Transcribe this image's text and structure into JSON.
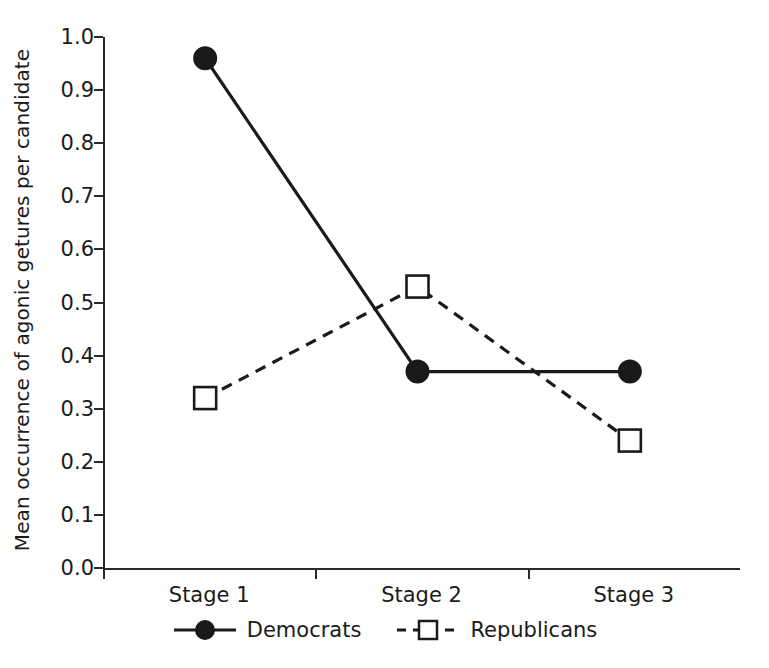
{
  "chart_data": {
    "type": "line",
    "title": "",
    "xlabel": "",
    "ylabel": "Mean occurrence of agonic getures per candidate",
    "categories": [
      "Stage 1",
      "Stage 2",
      "Stage 3"
    ],
    "ylim": [
      0.0,
      1.0
    ],
    "ytick_labels": [
      "0.0",
      "0.1",
      "0.2",
      "0.3",
      "0.4",
      "0.5",
      "0.6",
      "0.7",
      "0.8",
      "0.9",
      "1.0"
    ],
    "ytick_values": [
      0.0,
      0.1,
      0.2,
      0.3,
      0.4,
      0.5,
      0.6,
      0.7,
      0.8,
      0.9,
      1.0
    ],
    "grid": false,
    "legend_position": "bottom-center",
    "series": [
      {
        "name": "Democrats",
        "values": [
          0.96,
          0.37,
          0.37
        ],
        "marker": "filled-circle",
        "line_style": "solid",
        "color": "#1a1a1a"
      },
      {
        "name": "Republicans",
        "values": [
          0.32,
          0.53,
          0.24
        ],
        "marker": "open-square",
        "line_style": "dashed",
        "color": "#1a1a1a"
      }
    ]
  },
  "axis": {
    "y_title": "Mean occurrence of agonic getures per candidate"
  },
  "legend": {
    "items": [
      {
        "label": "Democrats"
      },
      {
        "label": "Republicans"
      }
    ]
  },
  "colors": {
    "foreground": "#1a1a1a",
    "axis": "#2b2b2b",
    "background": "#ffffff"
  }
}
